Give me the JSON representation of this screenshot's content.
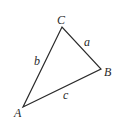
{
  "diagram": {
    "type": "triangle",
    "stroke_color": "#2a2a2a",
    "background": "#ffffff",
    "vertices": [
      {
        "id": "A",
        "label": "A",
        "x": 23,
        "y": 107,
        "label_x": 14,
        "label_y": 117
      },
      {
        "id": "B",
        "label": "B",
        "x": 101,
        "y": 69,
        "label_x": 104,
        "label_y": 76
      },
      {
        "id": "C",
        "label": "C",
        "x": 62,
        "y": 27,
        "label_x": 57,
        "label_y": 24
      }
    ],
    "sides": [
      {
        "id": "a",
        "label": "a",
        "from": "C",
        "to": "B",
        "label_x": 84,
        "label_y": 46
      },
      {
        "id": "b",
        "label": "b",
        "from": "A",
        "to": "C",
        "label_x": 34,
        "label_y": 65
      },
      {
        "id": "c",
        "label": "c",
        "from": "A",
        "to": "B",
        "label_x": 63,
        "label_y": 99
      }
    ]
  }
}
